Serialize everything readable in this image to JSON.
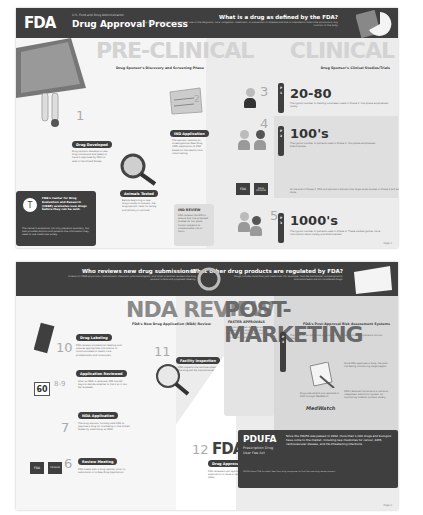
{
  "page1": {
    "header": {
      "logo": "FDA",
      "agency": "U.S. Food and Drug Administration",
      "title": "Drug Approval Process",
      "question": "What is a drug as defined by the FDA?",
      "answer": "A drug is any product that is intended for use in the diagnosis, cure, mitigation, treatment, or prevention of disease and that is intended to affect the structure or any function of the body."
    },
    "preclinical": {
      "big_label": "PRE-CLINICAL",
      "subtitle": "Drug Sponsor's Discovery and Screening Phase",
      "steps": [
        {
          "number": "1",
          "label": "Drug Developed",
          "text": "Drug sponsor develops a new drug compound and seeks to have it approved by FDA for sale in the United States."
        },
        {
          "number": "",
          "label": "Animals Tested",
          "text": "Before beginning a new drug's study in humans, the drug sponsor tests for safety and efficacy in animals."
        },
        {
          "number": "2",
          "label": "IND Application",
          "text": "The sponsor submits an Investigational New Drug (IND) application to FDA based on the results from initial testing."
        }
      ],
      "ind_review": {
        "title": "IND REVIEW",
        "text": "FDA reviews the IND to assure that the proposed studies do not place human subjects at unreasonable risk of harm."
      },
      "cder": {
        "title": "FDA's Center for Drug Evaluation and Research (CDER) evaluates new drugs before they can be sold.",
        "text": "The center's evaluation not only prevents quackery, but also provides doctors and patients the information they need to use medicines wisely."
      }
    },
    "clinical": {
      "big_label": "CLINICAL",
      "subtitle": "Drug Sponsor's Clinical Studies/Trials",
      "phases": [
        {
          "step": "3",
          "phase": "PHASE 1",
          "stat": "20-80",
          "text": "The typical number of healthy volunteers used in Phase 1; this phase emphasizes safety."
        },
        {
          "step": "4",
          "phase": "PHASE 2",
          "stat": "100's",
          "text": "The typical number of patients used in Phase 2; this phase emphasizes effectiveness."
        },
        {
          "step": "5",
          "phase": "PHASE 3",
          "stat": "1000's",
          "text": "The typical number of patients used in Phase 3. These studies gather more information about safety and effectiveness."
        }
      ],
      "meeting_note": "At the end of Phase 2, FDA and sponsors discuss how large-scale studies in Phase 3 will be done.",
      "podium_labels": [
        "FDA",
        "DRUG SPONSOR"
      ]
    },
    "page_number": "Page 1"
  },
  "page2": {
    "header_left": {
      "question": "Who reviews new drug submissions?",
      "answer": "A team of CDER physicians, statisticians, chemists, pharmacologists, and other scientists reviews the drug sponsor's data and proposed labeling."
    },
    "header_right": {
      "question": "What other drug products are regulated by FDA?",
      "answer": "Drugs include more than just medicines. For example, fluoride toothpaste, antiperspirants, and sunscreens are all considered drugs."
    },
    "nda": {
      "big_label": "NDA REVIEW",
      "subtitle": "FDA's New Drug Application (NDA) Review",
      "steps": [
        {
          "number": "10",
          "label": "Drug Labeling",
          "text": "FDA reviews professional labeling and assures appropriate information is communicated to health care professionals and consumers."
        },
        {
          "number": "11",
          "label": "Facility Inspection",
          "text": "FDA inspects the facilities where the drug will be manufactured."
        },
        {
          "number": "8-9",
          "label": "Application Reviewed",
          "text": "After an NDA is received, FDA has 60 days to decide whether to file it so it can be reviewed."
        },
        {
          "number": "7",
          "label": "NDA Application",
          "text": "The drug sponsor formally asks FDA to approve a drug for marketing in the United States by submitting an NDA."
        },
        {
          "number": "6",
          "label": "Review Meeting",
          "text": "FDA meets with a drug sponsor prior to submission of a New Drug Application."
        },
        {
          "number": "12",
          "label": "Drug Approval",
          "text": "FDA reviewers will approve the application or issue a response letter."
        }
      ],
      "calendar_value": "60",
      "faster": {
        "title": "FASTER APPROVALS",
        "text": "The Accelerated Approval program allows earlier approval of drugs that treat serious diseases and fill an unmet medical need."
      }
    },
    "post": {
      "big_label": "POST-MARKETING",
      "subtitle": "FDA's Post-Approval Risk Assessment Systems",
      "phase": "PHASE 4",
      "intro": "The need for an adequate population of all rare or otherwise patients mirrors drugs.",
      "monitoring": "Once FDA approves a drug, the post-marketing monitoring stage begins.",
      "medwatch_text": "Drug side effects are reported to FDA through MedWatch.",
      "medwatch_logo": "MedWatch",
      "sentinel": "FDA's Sentinel Initiative is a national, integrated, electronic system for monitoring medical product safety."
    },
    "pdufa": {
      "acronym": "PDUFA",
      "full": "Prescription Drug User Fee Act",
      "text": "Since the PDUFA was passed in 1992, more than 1,000 drugs and biologics have come to the market, including new medicines for cancer, AIDS, cardiovascular disease, and life-threatening infections.",
      "footnote": "PDUFA allows FDA to collect fees from drug companies to fund the new drug review process."
    },
    "page_number": "Page 2"
  }
}
